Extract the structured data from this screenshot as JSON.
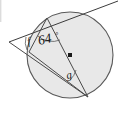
{
  "figure": {
    "type": "geometry-diagram",
    "shape": "circle",
    "labels": {
      "angle_known": "64",
      "degree_symbol": "°",
      "angle_f": "f",
      "angle_g": "g"
    },
    "colors": {
      "circle_fill": "#e8e8e8",
      "circle_stroke": "#595959",
      "line_stroke": "#4a4a4a",
      "text": "#141414",
      "background": "#ffffff"
    },
    "geometry": {
      "circle_center_x": 70,
      "circle_center_y": 55,
      "circle_radius": 43,
      "tangent_point_x": 47,
      "tangent_point_y": 18,
      "external_vertex_x": 9,
      "external_vertex_y": 42,
      "left_chord_point_x": 29,
      "left_chord_point_y": 52,
      "bottom_right_point_x": 88,
      "bottom_right_point_y": 97,
      "tangent_far_x": 118,
      "tangent_far_y": 1
    }
  }
}
